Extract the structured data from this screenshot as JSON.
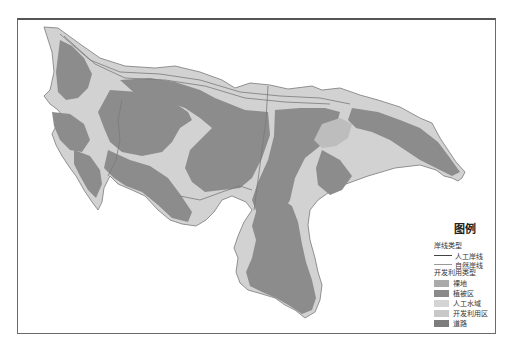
{
  "map": {
    "colors": {
      "bare_land": "#a9a9a9",
      "vegetation": "#8c8c8c",
      "artificial_water": "#cfcfcf",
      "development": "#d2d2d2",
      "road": "#7a7a7a",
      "shoreline_artificial": "#555555",
      "shoreline_natural": "#9a9a9a"
    }
  },
  "legend": {
    "title": "图例",
    "shoreline_section": "岸线类型",
    "shoreline_items": [
      {
        "label": "人工岸线",
        "type": "artificial"
      },
      {
        "label": "自然岸线",
        "type": "natural"
      }
    ],
    "use_section": "开发利用类型",
    "use_items": [
      {
        "label": "裸地",
        "color": "#aaaaaa"
      },
      {
        "label": "植被区",
        "color": "#8a8a8a"
      },
      {
        "label": "人工水域",
        "color": "#d4d4d4"
      },
      {
        "label": "开发利用区",
        "color": "#c8c8c8"
      },
      {
        "label": "道路",
        "color": "#7c7c7c"
      }
    ]
  }
}
